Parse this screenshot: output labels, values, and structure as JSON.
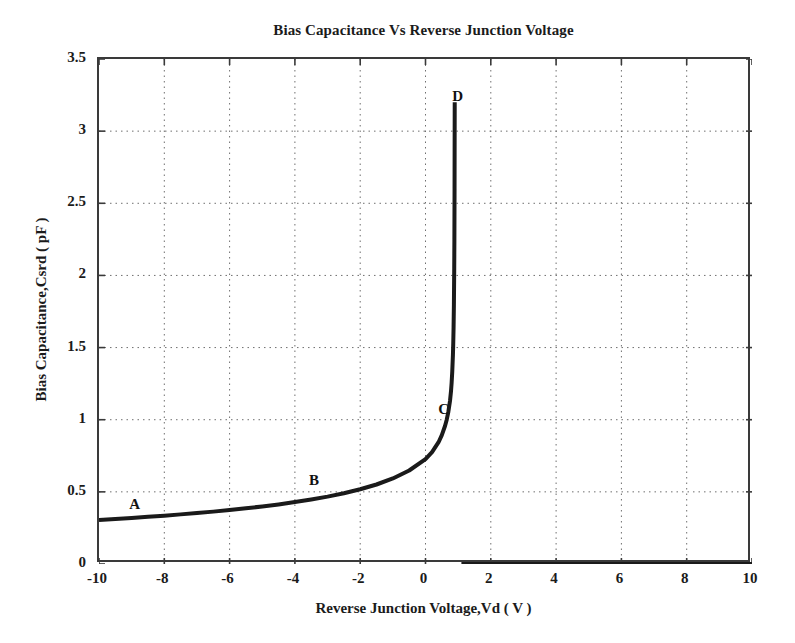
{
  "chart_data": {
    "type": "line",
    "title": "Bias Capacitance Vs Reverse Junction Voltage",
    "xlabel": "Reverse Junction Voltage,Vd ( V )",
    "ylabel": "Bias Capacitance,Csrd ( pF )",
    "xlim": [
      -10,
      10
    ],
    "ylim": [
      0,
      3.5
    ],
    "xticks": [
      -10,
      -8,
      -6,
      -4,
      -2,
      0,
      2,
      4,
      6,
      8,
      10
    ],
    "xtick_labels": [
      "-10",
      "-8",
      "-6",
      "-4",
      "-2",
      "0",
      "2",
      "4",
      "6",
      "8",
      "10"
    ],
    "yticks": [
      0,
      0.5,
      1,
      1.5,
      2,
      2.5,
      3,
      3.5
    ],
    "ytick_labels": [
      "0",
      "0.5",
      "1",
      "1.5",
      "2",
      "2.5",
      "3",
      "3.5"
    ],
    "grid": true,
    "grid_style": "dotted",
    "legend": null,
    "line_color": "#1a1a1a",
    "line_width": 4,
    "series": [
      {
        "name": "Csrd(Vd)",
        "x": [
          -10.0,
          -9.5,
          -9.0,
          -8.5,
          -8.0,
          -7.5,
          -7.0,
          -6.5,
          -6.0,
          -5.5,
          -5.0,
          -4.5,
          -4.0,
          -3.5,
          -3.0,
          -2.5,
          -2.0,
          -1.5,
          -1.0,
          -0.5,
          0.0,
          0.2,
          0.4,
          0.5,
          0.6,
          0.65,
          0.7,
          0.75,
          0.78,
          0.8,
          0.82,
          0.84,
          0.85,
          0.86,
          0.87,
          0.88,
          0.885,
          0.89,
          0.893,
          0.895
        ],
        "y": [
          0.305,
          0.312,
          0.319,
          0.327,
          0.335,
          0.344,
          0.353,
          0.363,
          0.374,
          0.386,
          0.399,
          0.413,
          0.429,
          0.447,
          0.467,
          0.49,
          0.518,
          0.551,
          0.593,
          0.648,
          0.727,
          0.775,
          0.844,
          0.893,
          0.958,
          1.0,
          1.055,
          1.13,
          1.195,
          1.255,
          1.335,
          1.45,
          1.53,
          1.64,
          1.8,
          2.05,
          2.25,
          2.6,
          3.0,
          3.2
        ]
      },
      {
        "name": "Csrd-forward-clamp",
        "x": [
          1.1,
          2.0,
          4.0,
          6.0,
          8.0,
          10.0
        ],
        "y": [
          0.0,
          0.0,
          0.0,
          0.0,
          0.0,
          0.0
        ]
      }
    ],
    "annotations": [
      {
        "text": "A",
        "x": -8.85,
        "y": 0.4
      },
      {
        "text": "B",
        "x": -3.35,
        "y": 0.565
      },
      {
        "text": "C",
        "x": 0.62,
        "y": 1.06
      },
      {
        "text": "D",
        "x": 1.05,
        "y": 3.23
      }
    ]
  },
  "figure": {
    "background_color": "#ffffff",
    "axis_color": "#3a3a3a",
    "grid_color": "#6f6f6f",
    "text_color": "#1b1b1b"
  }
}
